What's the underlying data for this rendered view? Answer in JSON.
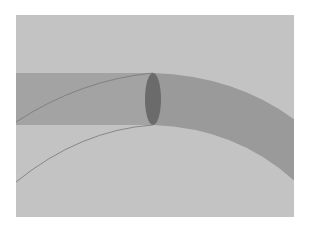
{
  "figure": {
    "colors": {
      "page_background": "#ffffff",
      "panel_background": "#c3c3c3",
      "straight_tube": "#a3a3a3",
      "curved_tube": "#9a9a9a",
      "cross_section": "#6b6b6b",
      "arc_lines": "#777777"
    },
    "panel": {
      "x": 16,
      "y": 15,
      "width": 278,
      "height": 202
    },
    "cross_section": {
      "cx": 153,
      "cy": 99,
      "rx": 8,
      "ry": 26
    }
  }
}
